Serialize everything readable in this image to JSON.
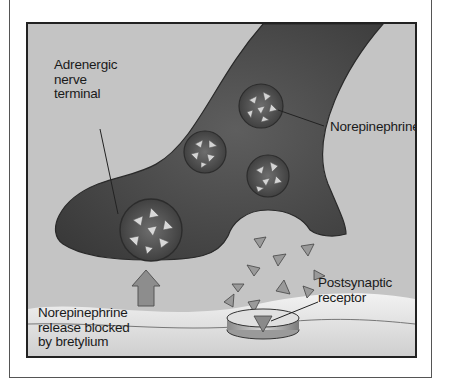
{
  "diagram": {
    "labels": {
      "nerve_terminal": [
        "Adrenergic",
        "nerve",
        "terminal"
      ],
      "norepinephrine": "Norepinephrine",
      "postsynaptic_receptor": [
        "Postsynaptic",
        "receptor"
      ],
      "blocked_release": [
        "Norepinephrine",
        "release blocked",
        "by bretylium"
      ]
    },
    "colors": {
      "background": "#c4c4c4",
      "nerve_terminal": "#4a4a4a",
      "vesicle": "#5c5c5c",
      "neurotransmitter": "#8a8a8a",
      "membrane": "#e6e6e6",
      "border": "#222222"
    }
  }
}
